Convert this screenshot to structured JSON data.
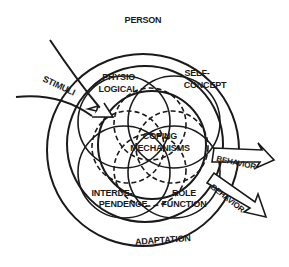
{
  "diagram": {
    "type": "Roy Adaptation Model",
    "labels": {
      "person": "PERSON",
      "stimuli": "STIMULI",
      "physiological_1": "PHYSIO-",
      "physiological_2": "LOGICAL",
      "self_concept_1": "SELF-",
      "self_concept_2": "CONCEPT",
      "coping_1": "COPING",
      "coping_2": "MECHANISMS",
      "interdependence_1": "INTERDE-",
      "interdependence_2": "PENDENCE",
      "role_1": "ROLE",
      "role_2": "FUNCTION",
      "behavior_top": "BEHAVIOR",
      "behavior_bottom": "BEHAVIOR",
      "adaptation": "ADAPTATION"
    },
    "colors": {
      "stroke": "#1a1a1a",
      "background": "#ffffff"
    }
  }
}
